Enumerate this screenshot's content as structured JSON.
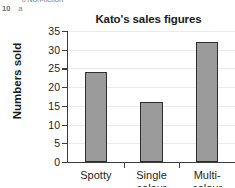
{
  "page_fragment": {
    "bullet_glyph": "b",
    "top_line": "Non-fiction",
    "question_number": "10",
    "question_part": "a"
  },
  "chart_data": {
    "type": "bar",
    "title": "Kato's sales figures",
    "xlabel": "",
    "ylabel": "Numbers sold",
    "categories": [
      "Spotty",
      "Single colour",
      "Multi-colour"
    ],
    "category_lines": [
      [
        "Spotty"
      ],
      [
        "Single",
        "colour"
      ],
      [
        "Multi-",
        "colour"
      ]
    ],
    "values": [
      24,
      16,
      32
    ],
    "ylim": [
      0,
      35
    ],
    "ytick_step": 5,
    "yticks": [
      0,
      5,
      10,
      15,
      20,
      25,
      30,
      35
    ],
    "ytick_labels": [
      "0",
      "5",
      "10",
      "15",
      "20",
      "25",
      "30",
      "35"
    ],
    "grid": true,
    "legend": "none",
    "bar_fill_color": "#9b9b9b",
    "bar_edge_color": "#2e2e2e",
    "axis_color": "#3b3b3b",
    "gridline_color": "#ececec"
  }
}
